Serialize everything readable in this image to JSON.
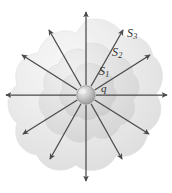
{
  "figure": {
    "background_color": "#ffffff",
    "labels": {
      "charge": {
        "text": "q",
        "x": 101,
        "y": 83
      },
      "surface_1": {
        "base": "S",
        "sub": "1",
        "x": 99,
        "y": 65
      },
      "surface_2": {
        "base": "S",
        "sub": "2",
        "x": 112,
        "y": 46
      },
      "surface_3": {
        "base": "S",
        "sub": "3",
        "x": 127,
        "y": 27
      }
    },
    "charge_sphere": {
      "name": "point-charge",
      "cx": 86,
      "cy": 95,
      "r": 9,
      "fill_light": "#e6e6e6",
      "fill_dark": "#9a9a9a",
      "stroke": "#8c8c8c"
    },
    "surfaces": [
      {
        "name": "gaussian-surface-1",
        "label": "S1",
        "scale": 0.4,
        "fill": "#c9c9c9",
        "opacity": 0.55
      },
      {
        "name": "gaussian-surface-2",
        "label": "S2",
        "scale": 0.68,
        "fill": "#d2d2d2",
        "opacity": 0.5
      },
      {
        "name": "gaussian-surface-3",
        "label": "S3",
        "scale": 1.0,
        "fill": "#dcdcdc",
        "opacity": 0.5
      }
    ],
    "field_lines": {
      "name": "electric-field-lines",
      "count": 12,
      "color": "#4a4a4a",
      "origin_x": 86,
      "origin_y": 95,
      "inner_radius": 10,
      "vectors": [
        {
          "angle_deg": 90,
          "length": 85,
          "direction": "up"
        },
        {
          "angle_deg": 60,
          "length": 74,
          "direction": "up-right"
        },
        {
          "angle_deg": 30,
          "length": 73,
          "direction": "right-up"
        },
        {
          "angle_deg": 0,
          "length": 81,
          "direction": "right"
        },
        {
          "angle_deg": -30,
          "length": 72,
          "direction": "right-down"
        },
        {
          "angle_deg": -60,
          "length": 74,
          "direction": "down-right"
        },
        {
          "angle_deg": -90,
          "length": 85,
          "direction": "down"
        },
        {
          "angle_deg": -120,
          "length": 74,
          "direction": "down-left"
        },
        {
          "angle_deg": -150,
          "length": 72,
          "direction": "left-down"
        },
        {
          "angle_deg": 180,
          "length": 81,
          "direction": "left"
        },
        {
          "angle_deg": 150,
          "length": 73,
          "direction": "left-up"
        },
        {
          "angle_deg": 120,
          "length": 74,
          "direction": "up-left"
        }
      ]
    }
  }
}
